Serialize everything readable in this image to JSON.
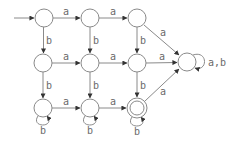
{
  "diagram": {
    "type": "DFA",
    "states": [
      {
        "id": "q00",
        "cx": 44,
        "cy": 18,
        "start": true,
        "accept": false
      },
      {
        "id": "q01",
        "cx": 90,
        "cy": 18,
        "start": false,
        "accept": false
      },
      {
        "id": "q02",
        "cx": 137,
        "cy": 18,
        "start": false,
        "accept": false
      },
      {
        "id": "q10",
        "cx": 43,
        "cy": 63,
        "start": false,
        "accept": false
      },
      {
        "id": "q11",
        "cx": 90,
        "cy": 63,
        "start": false,
        "accept": false
      },
      {
        "id": "q12",
        "cx": 137,
        "cy": 63,
        "start": false,
        "accept": false
      },
      {
        "id": "q20",
        "cx": 43,
        "cy": 108,
        "start": false,
        "accept": false
      },
      {
        "id": "q21",
        "cx": 90,
        "cy": 108,
        "start": false,
        "accept": false
      },
      {
        "id": "q22",
        "cx": 137,
        "cy": 108,
        "start": false,
        "accept": true
      },
      {
        "id": "sink",
        "cx": 187,
        "cy": 62,
        "start": false,
        "accept": false
      }
    ],
    "transitions": [
      {
        "from": "q00",
        "to": "q01",
        "label": "a"
      },
      {
        "from": "q01",
        "to": "q02",
        "label": "a"
      },
      {
        "from": "q02",
        "to": "sink",
        "label": "a"
      },
      {
        "from": "q00",
        "to": "q10",
        "label": "b"
      },
      {
        "from": "q01",
        "to": "q11",
        "label": "b"
      },
      {
        "from": "q02",
        "to": "q12",
        "label": "b"
      },
      {
        "from": "q10",
        "to": "q11",
        "label": "a"
      },
      {
        "from": "q11",
        "to": "q12",
        "label": "a"
      },
      {
        "from": "q12",
        "to": "sink",
        "label": "a"
      },
      {
        "from": "q10",
        "to": "q20",
        "label": "b"
      },
      {
        "from": "q11",
        "to": "q21",
        "label": "b"
      },
      {
        "from": "q12",
        "to": "q22",
        "label": "b"
      },
      {
        "from": "q20",
        "to": "q21",
        "label": "a"
      },
      {
        "from": "q21",
        "to": "q22",
        "label": "a"
      },
      {
        "from": "q22",
        "to": "sink",
        "label": "a"
      },
      {
        "from": "q20",
        "to": "q20",
        "label": "b"
      },
      {
        "from": "q21",
        "to": "q21",
        "label": "b"
      },
      {
        "from": "q22",
        "to": "q22",
        "label": "b"
      },
      {
        "from": "sink",
        "to": "sink",
        "label": "a,b"
      }
    ],
    "labels": {
      "a": "a",
      "b": "b",
      "ab": "a,b"
    }
  }
}
